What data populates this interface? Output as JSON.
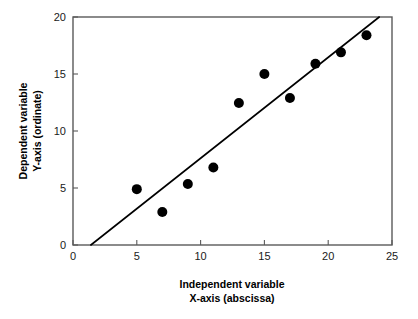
{
  "chart_data": {
    "type": "scatter",
    "title": "",
    "subtitle": "",
    "xlabel": "Independent variable\nX-axis (abscissa)",
    "xlabel_line1": "Independent variable",
    "xlabel_line2": "X-axis (abscissa)",
    "ylabel": "Dependent variable\nY-axis (ordinate)",
    "ylabel_line1": "Dependent variable",
    "ylabel_line2": "Y-axis (ordinate)",
    "xlim": [
      0,
      25
    ],
    "ylim": [
      0,
      20
    ],
    "xticks": [
      0,
      5,
      10,
      15,
      20,
      25
    ],
    "yticks": [
      0,
      5,
      10,
      15,
      20
    ],
    "xtick_labels": [
      "0",
      "5",
      "10",
      "15",
      "20",
      "25"
    ],
    "ytick_labels": [
      "0",
      "5",
      "10",
      "15",
      "20"
    ],
    "grid": false,
    "legend": false,
    "legend_position": "none",
    "tick_direction": "in",
    "marker": "filled-circle",
    "marker_color": "#000000",
    "marker_size_px": 5,
    "x": [
      5,
      7,
      9,
      11,
      13,
      15,
      17,
      19,
      21,
      23
    ],
    "y": [
      4.9,
      2.9,
      5.35,
      6.8,
      12.45,
      15.0,
      12.9,
      15.9,
      16.9,
      18.4
    ],
    "points": [
      {
        "x": 5,
        "y": 4.9
      },
      {
        "x": 7,
        "y": 2.9
      },
      {
        "x": 9,
        "y": 5.35
      },
      {
        "x": 11,
        "y": 6.8
      },
      {
        "x": 13,
        "y": 12.45
      },
      {
        "x": 15,
        "y": 15.0
      },
      {
        "x": 17,
        "y": 12.9
      },
      {
        "x": 19,
        "y": 15.9
      },
      {
        "x": 21,
        "y": 16.9
      },
      {
        "x": 23,
        "y": 18.4
      }
    ],
    "series": [
      {
        "name": "observations",
        "type": "scatter",
        "values": [
          4.9,
          2.9,
          5.35,
          6.8,
          12.45,
          15.0,
          12.9,
          15.9,
          16.9,
          18.4
        ]
      },
      {
        "name": "regression-line",
        "type": "line",
        "x_start": 1.4,
        "y_start": 0,
        "x_end": 24.0,
        "y_end": 20.0,
        "slope": 0.885,
        "intercept": -1.24,
        "color": "#000000"
      }
    ],
    "trend_line": {
      "x_start": 1.4,
      "y_start": 0,
      "x_end": 24.0,
      "y_end": 20.0
    },
    "frame": {
      "top": true,
      "right": true,
      "bottom": true,
      "left": true,
      "color": "#5a5a5a"
    }
  }
}
